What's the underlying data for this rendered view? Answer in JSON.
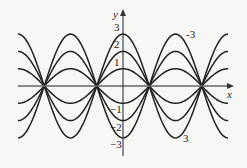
{
  "chart_data": {
    "type": "line",
    "title": "",
    "xlabel": "x",
    "ylabel": "y",
    "x_range": [
      -6.2832,
      6.2832
    ],
    "ylim": [
      -3.9,
      4.4
    ],
    "y_ticks": [
      3,
      2,
      1,
      -1,
      -2,
      -3
    ],
    "grid": false,
    "legend": "none (inline labels)",
    "series": [
      {
        "name": "3",
        "k": 3
      },
      {
        "name": "2",
        "k": 2
      },
      {
        "name": "1",
        "k": 1
      },
      {
        "name": "-1",
        "k": -1
      },
      {
        "name": "-2",
        "k": -2
      },
      {
        "name": "-3",
        "k": -3
      }
    ],
    "annotations": [
      {
        "text": "-3",
        "near": "curve k=-3 at top right (x≈π)"
      },
      {
        "text": "3",
        "near": "curve k=3 at bottom right (x≈π)"
      }
    ],
    "colors": {
      "curve": "#222222",
      "axis": "#555555"
    }
  }
}
